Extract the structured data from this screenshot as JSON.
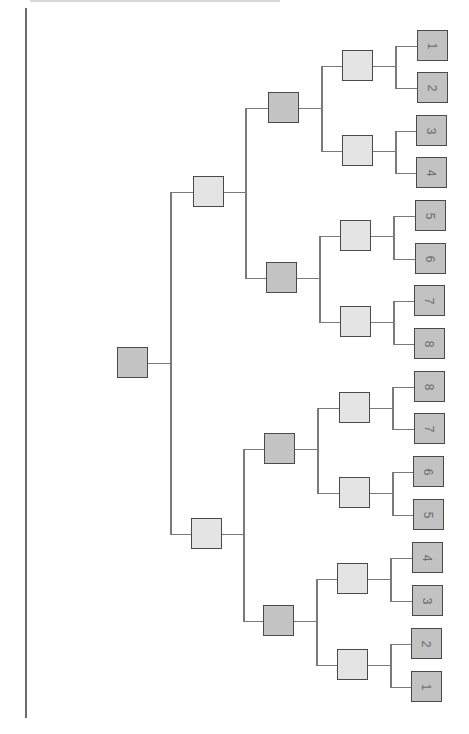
{
  "diagram": {
    "type": "bracket-tree",
    "orientation": "rotated 90deg (root on left, leaves on right)",
    "colors": {
      "root_fill": "#c4c4c4",
      "level1_fill": "#e4e4e4",
      "level2_fill": "#c4c4c4",
      "level3_fill": "#e4e4e4",
      "leaf_fill": "#c2c2c2",
      "border": "#4a4a4a",
      "connector": "#7a7a7a"
    },
    "root": {
      "x": 117,
      "y": 347
    },
    "level1": [
      {
        "x": 193,
        "y": 176
      },
      {
        "x": 191,
        "y": 518
      }
    ],
    "level2": [
      {
        "x": 268,
        "y": 92
      },
      {
        "x": 266,
        "y": 262
      },
      {
        "x": 264,
        "y": 433
      },
      {
        "x": 263,
        "y": 605
      }
    ],
    "level3": [
      {
        "x": 342,
        "y": 50
      },
      {
        "x": 342,
        "y": 135
      },
      {
        "x": 340,
        "y": 220
      },
      {
        "x": 340,
        "y": 306
      },
      {
        "x": 339,
        "y": 392
      },
      {
        "x": 339,
        "y": 477
      },
      {
        "x": 337,
        "y": 563
      },
      {
        "x": 337,
        "y": 649
      }
    ],
    "leaves": [
      {
        "label": "1",
        "x": 417,
        "y": 30
      },
      {
        "label": "2",
        "x": 417,
        "y": 72
      },
      {
        "label": "3",
        "x": 416,
        "y": 115
      },
      {
        "label": "4",
        "x": 416,
        "y": 157
      },
      {
        "label": "5",
        "x": 415,
        "y": 200
      },
      {
        "label": "6",
        "x": 415,
        "y": 243
      },
      {
        "label": "7",
        "x": 414,
        "y": 285
      },
      {
        "label": "8",
        "x": 414,
        "y": 328
      },
      {
        "label": "8",
        "x": 414,
        "y": 371
      },
      {
        "label": "7",
        "x": 414,
        "y": 413
      },
      {
        "label": "6",
        "x": 413,
        "y": 456
      },
      {
        "label": "5",
        "x": 413,
        "y": 499
      },
      {
        "label": "4",
        "x": 412,
        "y": 542
      },
      {
        "label": "3",
        "x": 412,
        "y": 585
      },
      {
        "label": "2",
        "x": 411,
        "y": 628
      },
      {
        "label": "1",
        "x": 411,
        "y": 671
      }
    ]
  }
}
